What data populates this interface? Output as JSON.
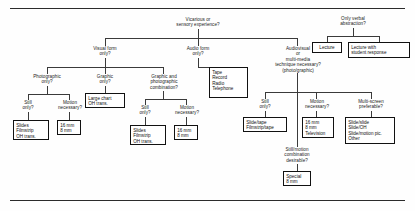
{
  "diagram": {
    "type": "decision-tree-flowchart",
    "root": {
      "id": "root-question",
      "label": "Vicarious or\nsensory experience?"
    },
    "verbal": {
      "id": "verbal-question",
      "label": "Only verbal\nabstraction?",
      "options": [
        {
          "id": "lecture",
          "label": "Lecture"
        },
        {
          "id": "lecture-with-student-response",
          "label": "Lecture with\nstudent response"
        }
      ]
    },
    "branches": [
      {
        "id": "visual-form",
        "label": "Visual form\nonly?",
        "children": [
          {
            "id": "photographic-only",
            "label": "Photographic\nonly?",
            "children": [
              {
                "id": "still-only-1",
                "label": "Still\nonly?",
                "terminal": "Slides\nFilmstrip\nOH trans."
              },
              {
                "id": "motion-necessary-1",
                "label": "Motion\nnecessary?",
                "terminal": "16 mm\n8 mm"
              }
            ]
          },
          {
            "id": "graphic-only",
            "label": "Graphic\nonly?",
            "terminal": "Large chart\nOH trans."
          },
          {
            "id": "graphic-and-photographic",
            "label": "Graphic and\nphotographic\ncombination?",
            "children": [
              {
                "id": "still-only-2",
                "label": "Still\nonly?",
                "terminal": "Slides\nFilmstrip\nOH trans."
              },
              {
                "id": "motion-necessary-2",
                "label": "Motion\nnecessary?",
                "terminal": "16 mm\n8 mm"
              }
            ]
          }
        ]
      },
      {
        "id": "audio-form",
        "label": "Audio form\nonly?",
        "terminal": "Tape\nRecord\nRadio\nTelephone"
      },
      {
        "id": "audiovisual",
        "label": "Audiovisual\nor\nmulti-media\ntechnique necessary?\n(photo/graphic)",
        "children": [
          {
            "id": "still-only-3",
            "label": "Still\nonly?",
            "terminal": "Slide/tape\nFilmstrip/tape"
          },
          {
            "id": "motion-necessary-3",
            "label": "Motion\nnecessary?",
            "terminal": "16 mm\n8 mm\nTelevision"
          },
          {
            "id": "multi-screen",
            "label": "Multi-screen\npreferable?",
            "terminal": "Slide/slide\nSlide/OH\nSlide/motion pic.\nOther"
          }
        ],
        "sub": {
          "id": "still-motion-combination",
          "label": "Still/motion\ncombination\ndesirable?",
          "terminal": "Special\n8 mm"
        }
      }
    ]
  }
}
